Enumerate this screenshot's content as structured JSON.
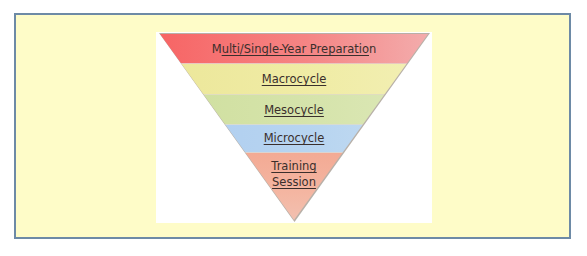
{
  "diagram": {
    "type": "inverted-pyramid",
    "title": "",
    "levels": [
      {
        "order": 1,
        "label": "Multi/Single-Year Preparation",
        "label_prefix": "M",
        "label_underlined": "ulti/Single-Year Preparatio",
        "label_suffix": "n",
        "color": "#f76565"
      },
      {
        "order": 2,
        "label": "Macrocycle",
        "color": "#eeea9f"
      },
      {
        "order": 3,
        "label": "Mesocycle",
        "color": "#d4e2a8"
      },
      {
        "order": 4,
        "label": "Microcycle",
        "color": "#b6d3f0"
      },
      {
        "order": 5,
        "label_line1": "Training",
        "label_line2": "Session",
        "color": "#f4b4a0"
      }
    ]
  },
  "colors": {
    "frame_border": "#6d8aa6",
    "frame_fill": "#fefcc8",
    "canvas_fill": "#ffffff",
    "text": "#3a2f2c"
  }
}
